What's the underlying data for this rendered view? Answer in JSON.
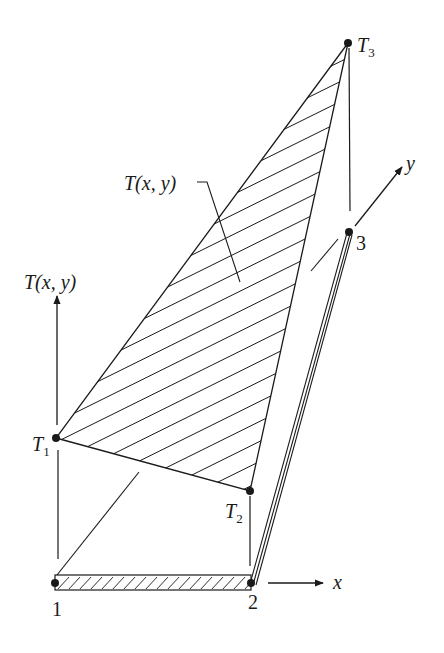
{
  "diagram": {
    "labels": {
      "t3": {
        "main": "T",
        "sub": "3"
      },
      "t1": {
        "main": "T",
        "sub": "1"
      },
      "t2": {
        "main": "T",
        "sub": "2"
      },
      "surface": "T(x, y)",
      "vertical_axis": "T(x, y)",
      "node1": "1",
      "node2": "2",
      "node3": "3",
      "x_axis": "x",
      "y_axis": "y"
    },
    "colors": {
      "ink": "#1a1a1a",
      "background": "#ffffff"
    }
  }
}
